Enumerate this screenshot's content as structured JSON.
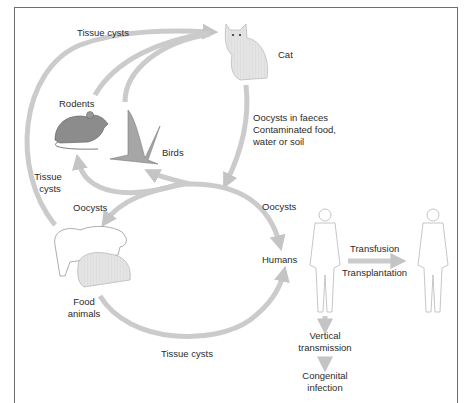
{
  "diagram": {
    "nodes": {
      "cat": "Cat",
      "rodents": "Rodents",
      "birds": "Birds",
      "food_animals_line1": "Food",
      "food_animals_line2": "animals",
      "humans": "Humans"
    },
    "edges": {
      "top_tissue_cysts": "Tissue cysts",
      "left_tissue_cysts_line1": "Tissue",
      "left_tissue_cysts_line2": "cysts",
      "cat_out_line1": "Oocysts in faeces",
      "cat_out_line2": "Contaminated food,",
      "cat_out_line3": "water or soil",
      "oocysts_left": "Oocysts",
      "oocysts_right": "Oocysts",
      "bottom_tissue_cysts": "Tissue cysts",
      "transfusion": "Transfusion",
      "transplantation": "Transplantation",
      "vertical_line1": "Vertical",
      "vertical_line2": "transmission",
      "congenital_line1": "Congenital",
      "congenital_line2": "infection"
    },
    "colors": {
      "arrow": "#c8c8c8",
      "border": "#6e6e6e",
      "text": "#2b2b2b",
      "animal_fill": "#d9d9d9",
      "rodent_fill": "#8a8a8a"
    }
  }
}
